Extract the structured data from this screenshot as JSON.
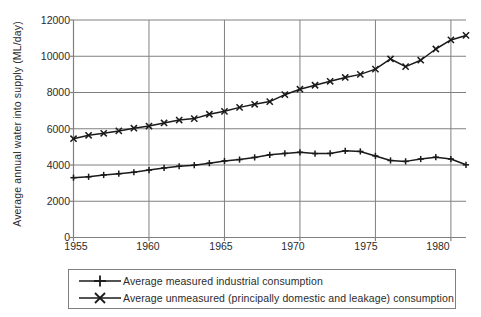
{
  "chart_data": {
    "type": "line",
    "title": "",
    "xlabel": "",
    "ylabel": "Average annual water into  supply (ML/day)",
    "xlim": [
      1955,
      1981
    ],
    "ylim": [
      0,
      12000
    ],
    "xticks": [
      1955,
      1960,
      1965,
      1970,
      1975,
      1980
    ],
    "yticks": [
      0,
      2000,
      4000,
      6000,
      8000,
      10000,
      12000
    ],
    "xtick_labels": [
      "1955",
      "1960",
      "1965",
      "1970",
      "1975",
      "1980"
    ],
    "ytick_labels": [
      "0",
      "2000",
      "4000",
      "6000",
      "8000",
      "10000",
      "12000"
    ],
    "grid": "horizontal-and-major-vertical",
    "legend_position": "below-plot",
    "x": [
      1955,
      1956,
      1957,
      1958,
      1959,
      1960,
      1961,
      1962,
      1963,
      1964,
      1965,
      1966,
      1967,
      1968,
      1969,
      1970,
      1971,
      1972,
      1973,
      1974,
      1975,
      1976,
      1977,
      1978,
      1979,
      1980,
      1981
    ],
    "series": [
      {
        "name": "Average measured industrial consumption",
        "marker": "plus",
        "color": "#1a1a1a",
        "values": [
          3300,
          3350,
          3450,
          3520,
          3600,
          3720,
          3840,
          3930,
          3990,
          4100,
          4220,
          4300,
          4420,
          4560,
          4640,
          4700,
          4630,
          4640,
          4780,
          4750,
          4500,
          4250,
          4200,
          4330,
          4430,
          4330,
          4010
        ]
      },
      {
        "name": "Average unmeasured (principally domestic and leakage) consumption",
        "marker": "cross",
        "color": "#1a1a1a",
        "values": [
          5450,
          5640,
          5750,
          5880,
          6030,
          6150,
          6320,
          6480,
          6560,
          6800,
          6960,
          7180,
          7350,
          7500,
          7880,
          8180,
          8400,
          8620,
          8830,
          9000,
          9290,
          9850,
          9430,
          9780,
          10400,
          10900,
          11150
        ]
      }
    ]
  },
  "legend": {
    "items": [
      {
        "label": "Average measured industrial consumption",
        "marker": "plus"
      },
      {
        "label": "Average unmeasured (principally domestic and leakage) consumption",
        "marker": "cross"
      }
    ]
  }
}
